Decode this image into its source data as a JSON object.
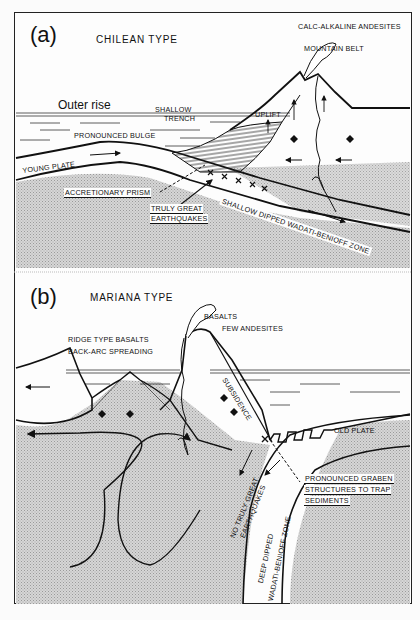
{
  "figure": {
    "panels": [
      {
        "id": "a",
        "letter": "(a)",
        "title": "CHILEAN TYPE",
        "labels": {
          "calc_alkaline": "CALC-ALKALINE ANDESITES",
          "mountain_belt": "MOUNTAIN BELT",
          "outer_rise": "Outer rise",
          "shallow": "SHALLOW",
          "trench": "TRENCH",
          "uplift": "UPLIFT",
          "bulge": "PRONOUNCED BULGE",
          "young_plate": "YOUNG PLATE",
          "accretionary_prism": "ACCRETIONARY PRISM",
          "truly_great_1": "TRULY GREAT",
          "truly_great_2": "EARTHQUAKES",
          "wadati_zone": "SHALLOW DIPPED WADATI-BENIOFF ZONE"
        }
      },
      {
        "id": "b",
        "letter": "(b)",
        "title": "MARIANA TYPE",
        "labels": {
          "basalts": "BASALTS",
          "few_andesites": "FEW ANDESITES",
          "ridge_basalts": "RIDGE TYPE BASALTS",
          "back_arc": "BACK-ARC SPREADING",
          "subsidence": "SUBSIDENCE",
          "old_plate": "OLD PLATE",
          "graben_1": "PRONOUNCED GRABEN",
          "graben_2": "STRUCTURES TO TRAP",
          "graben_3": "SEDIMENTS",
          "no_great_1": "NO TRULY GREAT",
          "no_great_2": "EARTHQUAKES",
          "deep_1": "DEEP DIPPED",
          "deep_2": "WADATI-BENIOFF ZONE"
        }
      }
    ],
    "colors": {
      "ink": "#111111",
      "paper": "#fdfdfd",
      "stipple": "#c9c9c9"
    }
  }
}
